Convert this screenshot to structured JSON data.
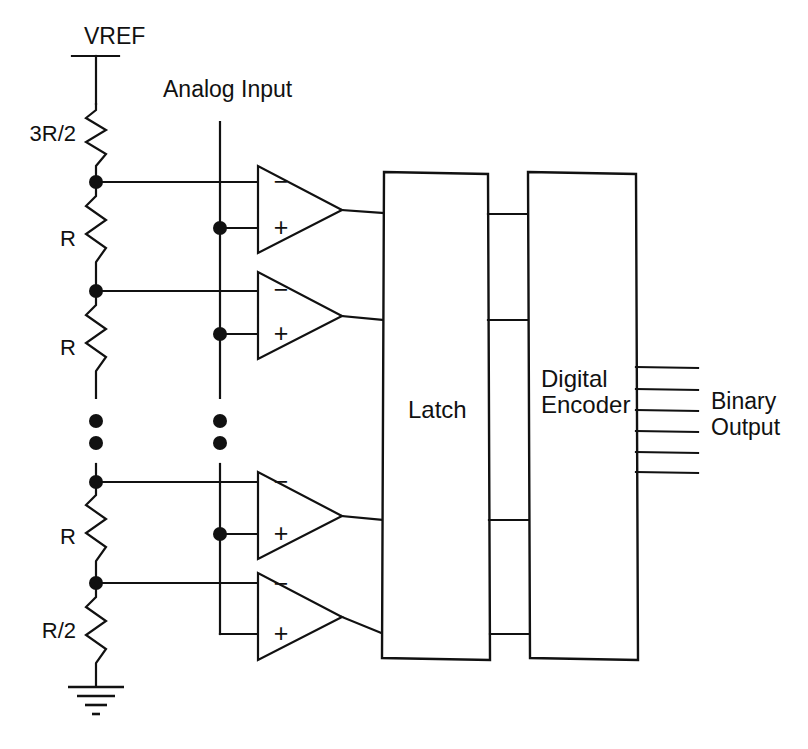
{
  "diagram": {
    "type": "schematic",
    "background_color": "#ffffff",
    "line_color": "#111111"
  },
  "labels": {
    "vref": "VREF",
    "analog_input": "Analog Input",
    "latch": "Latch",
    "encoder_line1": "Digital",
    "encoder_line2": "Encoder",
    "output_line1": "Binary",
    "output_line2": "Output"
  },
  "resistors": [
    {
      "label": "3R/2",
      "value": "3R/2"
    },
    {
      "label": "R",
      "value": "R"
    },
    {
      "label": "R",
      "value": "R"
    },
    {
      "label": "R",
      "value": "R"
    },
    {
      "label": "R/2",
      "value": "R/2"
    }
  ],
  "comparators": [
    {
      "id": "comparator-1",
      "minus": "−",
      "plus": "+"
    },
    {
      "id": "comparator-2",
      "minus": "−",
      "plus": "+"
    },
    {
      "id": "comparator-3",
      "minus": "−",
      "plus": "+"
    },
    {
      "id": "comparator-4",
      "minus": "−",
      "plus": "+"
    }
  ],
  "blocks": [
    {
      "id": "latch-block",
      "name": "Latch"
    },
    {
      "id": "digital-encoder-block",
      "name": "Digital Encoder"
    }
  ],
  "outputs": {
    "count": 6,
    "label": "Binary Output"
  },
  "ground": {
    "symbol": "earth-ground"
  },
  "ellipsis": {
    "ladder_dots": 2,
    "input_dots": 2
  }
}
